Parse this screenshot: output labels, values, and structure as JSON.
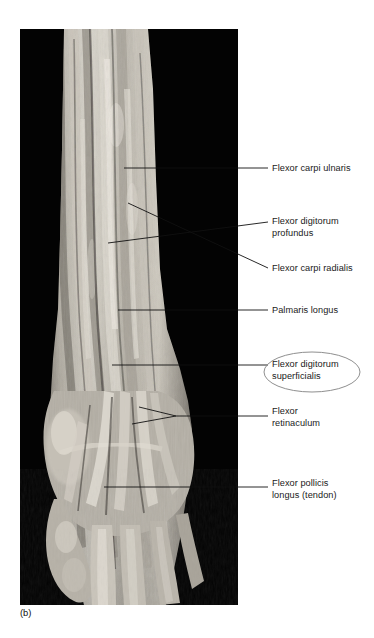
{
  "figure": {
    "caption": "(b)",
    "panel_background": "#030303",
    "page_background": "#ffffff",
    "label_color": "#1a1a1a",
    "leader_color": "#111111",
    "highlight_ellipse_color": "#8a8a8a",
    "specimen_tone_light": "#d8d4cb",
    "specimen_tone_mid": "#9c978c",
    "specimen_tone_dark": "#555049"
  },
  "labels": [
    {
      "id": "fcu",
      "text": "Flexor carpi ulnaris",
      "highlighted": "false"
    },
    {
      "id": "fdp",
      "text": "Flexor digitorum\nprofundus",
      "highlighted": "false"
    },
    {
      "id": "fcr",
      "text": "Flexor carpi radialis",
      "highlighted": "false"
    },
    {
      "id": "pl",
      "text": "Palmaris longus",
      "highlighted": "false"
    },
    {
      "id": "fds",
      "text": "Flexor digitorum\nsuperficialis",
      "highlighted": "true"
    },
    {
      "id": "fr",
      "text": "Flexor\nretinaculum",
      "highlighted": "false"
    },
    {
      "id": "fpl",
      "text": "Flexor pollicis\nlongus (tendon)",
      "highlighted": "false"
    }
  ]
}
